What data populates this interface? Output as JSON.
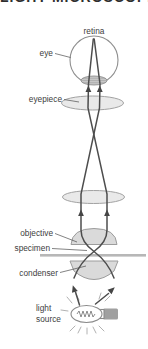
{
  "title": "LIGHT MICROSCOPE",
  "labels": {
    "retina": "retina",
    "eye": "eye",
    "eyepiece": "eyepiece",
    "objective": "objective",
    "specimen": "specimen",
    "condenser": "condenser",
    "light_source_line1": "light",
    "light_source_line2": "source"
  },
  "colors": {
    "background": "#ffffff",
    "ray_line": "#4d4d4d",
    "lens_fill": "#e0e0e0",
    "solid_lens_fill": "#d6d6d6",
    "lens_stroke": "#a2a2a2",
    "specimen_slide": "#b7b7b7",
    "bulb_base": "#a0a0a0",
    "label_text": "#3d3d3d",
    "title_text": "#2e2e2e"
  }
}
